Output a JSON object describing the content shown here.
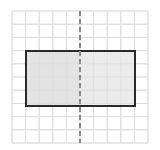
{
  "figure": {
    "title": "",
    "width": 160,
    "height": 150,
    "background_color": "#ffffff"
  },
  "grid": {
    "label": "square-grid",
    "x_start": 12,
    "y_start": 11,
    "x_end": 148,
    "y_end": 143,
    "columns": 10,
    "rows": 10,
    "cell_width": 13.6,
    "cell_height": 13.2,
    "line_color": "#dddddd",
    "line_width": 1,
    "visible": true
  },
  "shape": {
    "label": "rectangle",
    "type": "rectangle",
    "x": 26,
    "y": 51,
    "width": 109,
    "height": 55,
    "width_cells": 8,
    "height_cells": 4,
    "stroke_color": "#2a2a2a",
    "stroke_width": 2,
    "fill_left_color": "#e3e3e3",
    "fill_right_color": "#ebebeb"
  },
  "symmetry_line": {
    "label": "line-of-symmetry",
    "orientation": "vertical",
    "x": 80,
    "y_top": 11,
    "y_bottom": 143,
    "color": "#8a8a8a",
    "stroke_width": 2,
    "dash_length": 5,
    "gap_length": 3,
    "style": "dashed"
  },
  "chart_data": {
    "type": "scatter",
    "title": "",
    "xlabel": "",
    "ylabel": "",
    "grid": true,
    "legend": null,
    "xlim": [
      0,
      10
    ],
    "ylim": [
      0,
      10
    ],
    "categories": [],
    "values": [],
    "annotations": [
      {
        "name": "rectangle",
        "type": "rectangle",
        "x": 1,
        "y": 3,
        "width": 8,
        "height": 4,
        "corners": [
          [
            1,
            3
          ],
          [
            9,
            3
          ],
          [
            9,
            7
          ],
          [
            1,
            7
          ]
        ],
        "fill": "#e6e6e6",
        "stroke": "#2a2a2a"
      },
      {
        "name": "line-of-symmetry",
        "type": "vline",
        "x": 5,
        "y_range": [
          0,
          10
        ],
        "style": "dashed",
        "color": "#8a8a8a"
      }
    ]
  }
}
